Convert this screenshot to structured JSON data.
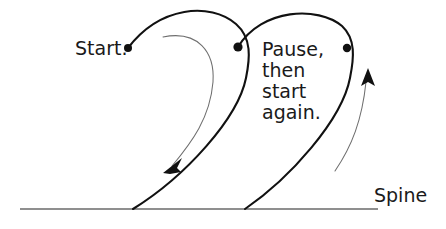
{
  "diagram": {
    "background_color": "#ffffff",
    "stroke_color": "#111111",
    "guide_color": "#6f6f6f",
    "spine_color": "#6a6a6a",
    "labels": {
      "start": "Start.",
      "pause_line1": "Pause,",
      "pause_line2": "then",
      "pause_line3": "start",
      "pause_line4": "again.",
      "spine": "Spine"
    },
    "markers": [
      {
        "name": "start-point",
        "x": 128,
        "y": 48
      },
      {
        "name": "pause-point",
        "x": 238,
        "y": 47
      },
      {
        "name": "restart-point",
        "x": 347,
        "y": 48
      }
    ],
    "arrows": [
      {
        "name": "downward-motion-arrow",
        "direction": "down-left",
        "tip_x": 166,
        "tip_y": 170
      },
      {
        "name": "upward-motion-arrow",
        "direction": "up",
        "tip_x": 368,
        "tip_y": 69
      }
    ],
    "spine_line": {
      "x1": 20,
      "y1": 209,
      "x2": 378,
      "y2": 209
    },
    "curve_paths": {
      "left_loop": "M128,48 C160,6 210,2 236,24 C252,38 250,58 246,78 C238,118 186,176 133,209",
      "right_loop": "M238,47 C262,8 318,6 342,26 C356,39 354,58 350,78 C342,120 290,178 245,209",
      "left_guide": "M163,37 C198,30 215,52 213,82 C210,118 192,142 172,166",
      "right_guide": "M335,171 C352,146 362,120 366,82"
    }
  }
}
